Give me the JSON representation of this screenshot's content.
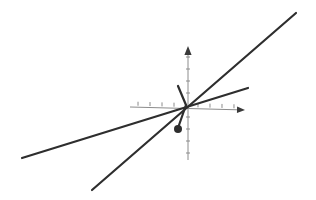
{
  "figure": {
    "title": "",
    "background_color": "#ffffff",
    "width": 316,
    "height": 200
  },
  "chart_data": {
    "type": "line",
    "title": "",
    "xlabel": "",
    "ylabel": "",
    "grid": false,
    "legend": null,
    "axes": {
      "origin_px": [
        186,
        105
      ],
      "x_axis": {
        "name": "x-axis",
        "color": "#8c8c8c",
        "line_width": 1,
        "start_px": [
          130,
          107
        ],
        "end_px": [
          245,
          110
        ],
        "arrow": "right",
        "tick_spacing_px": 12,
        "tick_length_px": 4,
        "ticks_positive": 4,
        "ticks_negative": 4
      },
      "y_axis": {
        "name": "y-axis",
        "color": "#8c8c8c",
        "line_width": 1,
        "start_px": [
          188,
          160
        ],
        "end_px": [
          188,
          46
        ],
        "arrow": "up",
        "tick_spacing_px": 12,
        "tick_length_px": 4,
        "ticks_positive": 4,
        "ticks_negative": 4
      }
    },
    "series": [
      {
        "name": "shallow-line",
        "kind": "line",
        "color": "#2e2e2e",
        "line_width": 2.2,
        "slope": 0.3,
        "points_px": [
          [
            22,
            158
          ],
          [
            248,
            88
          ]
        ],
        "values": {
          "x": [
            -5.5,
            1.5
          ],
          "y": [
            -1.65,
            0.45
          ]
        }
      },
      {
        "name": "steep-line",
        "kind": "line",
        "color": "#2e2e2e",
        "line_width": 2.2,
        "slope": 0.87,
        "points_px": [
          [
            92,
            190
          ],
          [
            296,
            13
          ]
        ],
        "values": {
          "x": [
            -2.3,
            2.7
          ],
          "y": [
            -2.0,
            2.3
          ]
        }
      },
      {
        "name": "short-segment-up-left",
        "kind": "line",
        "color": "#2e2e2e",
        "line_width": 2.2,
        "slope": -2.5,
        "points_px": [
          [
            186,
            105
          ],
          [
            178,
            86
          ]
        ],
        "values": {
          "x": [
            0,
            -0.2
          ],
          "y": [
            0,
            0.5
          ]
        }
      },
      {
        "name": "stem-to-point",
        "kind": "line",
        "color": "#2e2e2e",
        "line_width": 2.2,
        "points_px": [
          [
            186,
            105
          ],
          [
            178,
            128
          ]
        ],
        "values": {
          "x": [
            0,
            -0.2
          ],
          "y": [
            0,
            -0.6
          ]
        }
      }
    ],
    "markers": [
      {
        "name": "data-point",
        "shape": "filled-circle",
        "color": "#2e2e2e",
        "radius_px": 4,
        "position_px": [
          178,
          129
        ],
        "value": {
          "x": -0.2,
          "y": -0.65
        }
      }
    ]
  }
}
